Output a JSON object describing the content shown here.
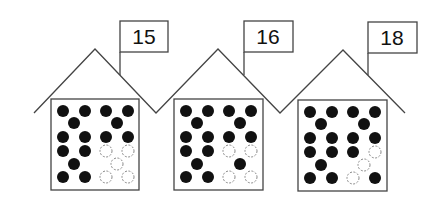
{
  "header": {
    "faint_text": "~~~~~"
  },
  "houses": [
    {
      "label": "15",
      "filled_count": 15,
      "empty_count": 5,
      "dots": [
        [
          1,
          1,
          1,
          1
        ],
        [
          1,
          1
        ],
        [
          1,
          1,
          1,
          1
        ],
        [
          1,
          1,
          0,
          0
        ],
        [
          1,
          0
        ],
        [
          1,
          1,
          0,
          0
        ]
      ]
    },
    {
      "label": "16",
      "filled_count": 16,
      "empty_count": 4,
      "dots": [
        [
          1,
          1,
          1,
          1
        ],
        [
          1,
          1
        ],
        [
          1,
          1,
          1,
          1
        ],
        [
          1,
          1,
          0,
          0
        ],
        [
          1,
          1
        ],
        [
          1,
          1,
          0,
          0
        ]
      ]
    },
    {
      "label": "18",
      "filled_count": 17,
      "empty_count": 3,
      "dots": [
        [
          1,
          1,
          1,
          1
        ],
        [
          1,
          1
        ],
        [
          1,
          1,
          1,
          1
        ],
        [
          1,
          1,
          1,
          0
        ],
        [
          1,
          0
        ],
        [
          1,
          1,
          0,
          1
        ]
      ]
    }
  ],
  "colors": {
    "line": "#444444",
    "dot": "#111111",
    "empty_dot": "#888888"
  }
}
